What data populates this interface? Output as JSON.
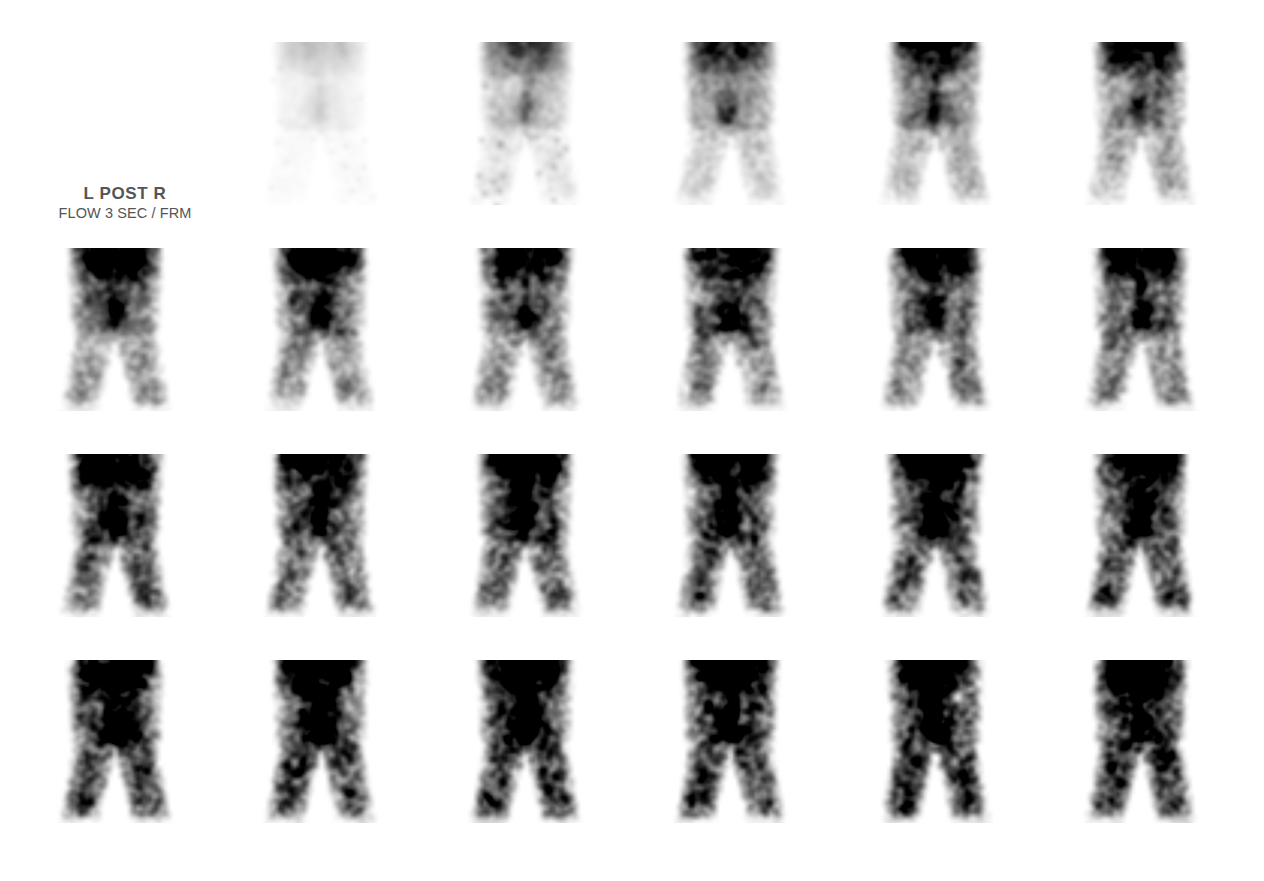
{
  "sheet": {
    "width": 1264,
    "height": 881,
    "background": "#ffffff",
    "modality": "nuclear-medicine-scintigraphy",
    "view": "posterior-pelvis-hips"
  },
  "annotation": {
    "orientation_label": "L POST R",
    "acquisition_label": "FLOW 3 SEC / FRM",
    "text_color": "#555555",
    "left": 40,
    "top": 183,
    "width": 170
  },
  "grid": {
    "rows": 4,
    "columns": 6,
    "origin_x": 55,
    "origin_y": 42,
    "column_pitch": 205,
    "row_pitch": 206,
    "frame_width": 120,
    "frame_height": 163
  },
  "render": {
    "pixel_grid": 48,
    "blur_radius": 1.1,
    "ink_color": "#1a1a1a",
    "top_band_darkness": 1.0,
    "hotspot_darkness": 0.95
  },
  "chart_data": {
    "type": "heatmap",
    "xlabel": "",
    "ylabel": "",
    "frames": [
      {
        "index": 1,
        "row": 0,
        "col": 1,
        "intensity": 0.05,
        "noise": 0.1,
        "top_band": 0.18,
        "hotspot": 0.1,
        "legs": 0.02,
        "seed": 101
      },
      {
        "index": 2,
        "row": 0,
        "col": 2,
        "intensity": 0.22,
        "noise": 0.26,
        "top_band": 0.62,
        "hotspot": 0.34,
        "legs": 0.1,
        "seed": 102
      },
      {
        "index": 3,
        "row": 0,
        "col": 3,
        "intensity": 0.34,
        "noise": 0.36,
        "top_band": 0.82,
        "hotspot": 0.44,
        "legs": 0.18,
        "seed": 103
      },
      {
        "index": 4,
        "row": 0,
        "col": 4,
        "intensity": 0.44,
        "noise": 0.44,
        "top_band": 0.92,
        "hotspot": 0.5,
        "legs": 0.26,
        "seed": 104
      },
      {
        "index": 5,
        "row": 0,
        "col": 5,
        "intensity": 0.5,
        "noise": 0.48,
        "top_band": 0.95,
        "hotspot": 0.54,
        "legs": 0.3,
        "seed": 105
      },
      {
        "index": 6,
        "row": 1,
        "col": 0,
        "intensity": 0.58,
        "noise": 0.54,
        "top_band": 0.97,
        "hotspot": 0.6,
        "legs": 0.38,
        "seed": 106
      },
      {
        "index": 7,
        "row": 1,
        "col": 1,
        "intensity": 0.6,
        "noise": 0.56,
        "top_band": 0.97,
        "hotspot": 0.66,
        "legs": 0.4,
        "seed": 107
      },
      {
        "index": 8,
        "row": 1,
        "col": 2,
        "intensity": 0.62,
        "noise": 0.57,
        "top_band": 0.97,
        "hotspot": 0.66,
        "legs": 0.42,
        "seed": 108
      },
      {
        "index": 9,
        "row": 1,
        "col": 3,
        "intensity": 0.64,
        "noise": 0.58,
        "top_band": 0.97,
        "hotspot": 0.7,
        "legs": 0.44,
        "seed": 109
      },
      {
        "index": 10,
        "row": 1,
        "col": 4,
        "intensity": 0.66,
        "noise": 0.6,
        "top_band": 0.97,
        "hotspot": 0.72,
        "legs": 0.46,
        "seed": 110
      },
      {
        "index": 11,
        "row": 1,
        "col": 5,
        "intensity": 0.68,
        "noise": 0.61,
        "top_band": 0.97,
        "hotspot": 0.74,
        "legs": 0.48,
        "seed": 111
      },
      {
        "index": 12,
        "row": 2,
        "col": 0,
        "intensity": 0.74,
        "noise": 0.66,
        "top_band": 0.98,
        "hotspot": 0.8,
        "legs": 0.58,
        "seed": 112
      },
      {
        "index": 13,
        "row": 2,
        "col": 1,
        "intensity": 0.75,
        "noise": 0.67,
        "top_band": 0.98,
        "hotspot": 0.82,
        "legs": 0.6,
        "seed": 113
      },
      {
        "index": 14,
        "row": 2,
        "col": 2,
        "intensity": 0.77,
        "noise": 0.68,
        "top_band": 0.98,
        "hotspot": 0.84,
        "legs": 0.61,
        "seed": 114
      },
      {
        "index": 15,
        "row": 2,
        "col": 3,
        "intensity": 0.76,
        "noise": 0.68,
        "top_band": 0.98,
        "hotspot": 0.8,
        "legs": 0.62,
        "seed": 115
      },
      {
        "index": 16,
        "row": 2,
        "col": 4,
        "intensity": 0.78,
        "noise": 0.69,
        "top_band": 0.98,
        "hotspot": 0.84,
        "legs": 0.63,
        "seed": 116
      },
      {
        "index": 17,
        "row": 2,
        "col": 5,
        "intensity": 0.79,
        "noise": 0.7,
        "top_band": 0.98,
        "hotspot": 0.86,
        "legs": 0.64,
        "seed": 117
      },
      {
        "index": 18,
        "row": 3,
        "col": 0,
        "intensity": 0.84,
        "noise": 0.74,
        "top_band": 0.99,
        "hotspot": 0.92,
        "legs": 0.7,
        "seed": 118
      },
      {
        "index": 19,
        "row": 3,
        "col": 1,
        "intensity": 0.85,
        "noise": 0.75,
        "top_band": 0.99,
        "hotspot": 0.92,
        "legs": 0.71,
        "seed": 119
      },
      {
        "index": 20,
        "row": 3,
        "col": 2,
        "intensity": 0.86,
        "noise": 0.75,
        "top_band": 0.99,
        "hotspot": 0.93,
        "legs": 0.72,
        "seed": 120
      },
      {
        "index": 21,
        "row": 3,
        "col": 3,
        "intensity": 0.85,
        "noise": 0.74,
        "top_band": 0.99,
        "hotspot": 0.88,
        "legs": 0.72,
        "seed": 121
      },
      {
        "index": 22,
        "row": 3,
        "col": 4,
        "intensity": 0.87,
        "noise": 0.76,
        "top_band": 0.99,
        "hotspot": 0.94,
        "legs": 0.73,
        "seed": 122
      },
      {
        "index": 23,
        "row": 3,
        "col": 5,
        "intensity": 0.88,
        "noise": 0.76,
        "top_band": 0.99,
        "hotspot": 0.95,
        "legs": 0.74,
        "seed": 123
      }
    ]
  }
}
